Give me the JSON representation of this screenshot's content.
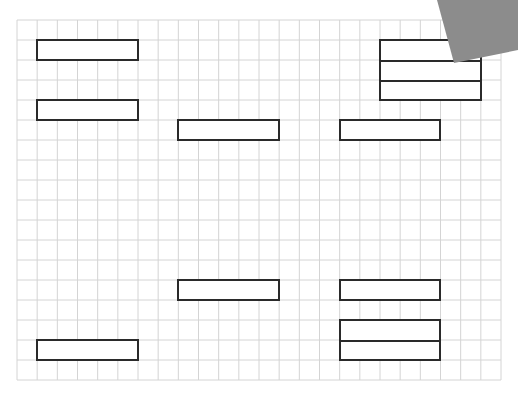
{
  "grid": {
    "left": 17,
    "top": 20,
    "right": 501,
    "bottom": 380,
    "cols": 24,
    "rows": 18,
    "line_color": "#d4d4d4",
    "border_color": "#cccccc"
  },
  "boxes": [
    {
      "id": "a1",
      "col": 1,
      "row": 1,
      "w": 5,
      "h": 1,
      "splits": 1
    },
    {
      "id": "a2",
      "col": 1,
      "row": 4,
      "w": 5,
      "h": 1,
      "splits": 1
    },
    {
      "id": "a3",
      "col": 1,
      "row": 16,
      "w": 5,
      "h": 1,
      "splits": 1
    },
    {
      "id": "b1",
      "col": 8,
      "row": 5,
      "w": 5,
      "h": 1,
      "splits": 1
    },
    {
      "id": "b2",
      "col": 8,
      "row": 13,
      "w": 5,
      "h": 1,
      "splits": 1
    },
    {
      "id": "c1",
      "col": 16,
      "row": 5,
      "w": 5,
      "h": 1,
      "splits": 1
    },
    {
      "id": "c2",
      "col": 16,
      "row": 13,
      "w": 5,
      "h": 1,
      "splits": 1
    },
    {
      "id": "c3",
      "col": 16,
      "row": 15,
      "w": 5,
      "h": 2,
      "splits": 2
    },
    {
      "id": "d1",
      "col": 18,
      "row": 1,
      "w": 5,
      "h": 3,
      "splits": 3
    }
  ],
  "overlay": {
    "points": "437,0 518,0 518,50 454,63",
    "color": "#8c8c8c"
  },
  "caption": ""
}
